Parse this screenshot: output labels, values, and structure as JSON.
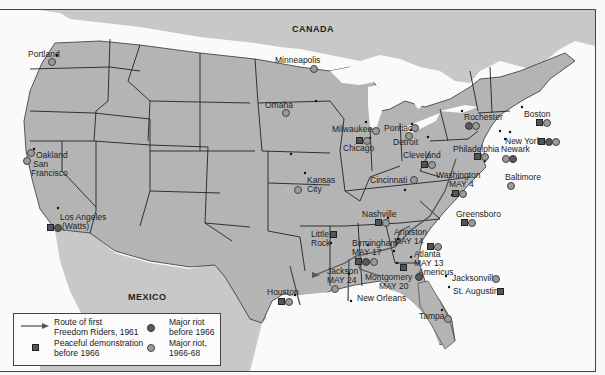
{
  "map": {
    "countries": {
      "north": "CANADA",
      "south": "MEXICO"
    },
    "colors": {
      "land": "#b4b4b4",
      "neighbor_land": "#c8c8c8",
      "water": "#fafafa",
      "borders": "#222222",
      "route": "#555555"
    },
    "cities": [
      {
        "name": "Portland",
        "markers": [
          "riot_1966_68"
        ]
      },
      {
        "name": "Oakland",
        "markers": [
          "riot_1966_68"
        ]
      },
      {
        "name": "San Francisco",
        "markers": [
          "riot_1966_68"
        ]
      },
      {
        "name": "Los Angeles (Watts)",
        "markers": [
          "peaceful",
          "riot_before_1966"
        ]
      },
      {
        "name": "Minneapolis",
        "markers": [
          "riot_1966_68"
        ]
      },
      {
        "name": "Omaha",
        "markers": [
          "riot_1966_68"
        ]
      },
      {
        "name": "Kansas City",
        "markers": [
          "riot_1966_68"
        ]
      },
      {
        "name": "Milwaukee",
        "markers": [
          "riot_1966_68"
        ]
      },
      {
        "name": "Chicago",
        "markers": [
          "peaceful",
          "riot_1966_68"
        ]
      },
      {
        "name": "Pontiac",
        "markers": [
          "riot_1966_68"
        ]
      },
      {
        "name": "Detroit",
        "markers": [
          "riot_1966_68"
        ]
      },
      {
        "name": "Cleveland",
        "markers": [
          "peaceful",
          "riot_1966_68"
        ]
      },
      {
        "name": "Cincinnati",
        "markers": [
          "riot_1966_68"
        ]
      },
      {
        "name": "Rochester",
        "markers": [
          "riot_before_1966",
          "riot_1966_68"
        ]
      },
      {
        "name": "Boston",
        "markers": [
          "peaceful",
          "riot_1966_68"
        ]
      },
      {
        "name": "New York",
        "markers": [
          "peaceful",
          "riot_before_1966",
          "riot_1966_68"
        ]
      },
      {
        "name": "Newark",
        "markers": [
          "riot_1966_68",
          "riot_before_1966"
        ]
      },
      {
        "name": "Philadelphia",
        "markers": [
          "peaceful",
          "riot_1966_68"
        ]
      },
      {
        "name": "Baltimore",
        "markers": [
          "riot_1966_68"
        ]
      },
      {
        "name": "Washington",
        "date": "MAY 4",
        "markers": [
          "peaceful",
          "riot_1966_68"
        ]
      },
      {
        "name": "Nashville",
        "markers": [
          "peaceful",
          "riot_1966_68"
        ]
      },
      {
        "name": "Greensboro",
        "markers": [
          "peaceful",
          "riot_1966_68"
        ]
      },
      {
        "name": "Little Rock",
        "markers": [
          "peaceful"
        ]
      },
      {
        "name": "Anniston",
        "date": "MAY 14",
        "markers": [
          "peaceful",
          "riot_1966_68"
        ]
      },
      {
        "name": "Birmingham",
        "date": "MAY 17",
        "markers": [
          "peaceful",
          "riot_before_1966",
          "riot_1966_68"
        ]
      },
      {
        "name": "Atlanta",
        "date": "MAY 13",
        "markers": []
      },
      {
        "name": "Americus",
        "markers": [
          "riot_before_1966"
        ]
      },
      {
        "name": "Montgomery",
        "date": "MAY 20",
        "markers": [
          "peaceful"
        ]
      },
      {
        "name": "Jackson",
        "date": "MAY 24",
        "markers": [
          "riot_1966_68"
        ]
      },
      {
        "name": "New Orleans",
        "markers": []
      },
      {
        "name": "Houston",
        "markers": [
          "peaceful",
          "riot_1966_68"
        ]
      },
      {
        "name": "Jacksonville",
        "markers": [
          "riot_1966_68"
        ]
      },
      {
        "name": "St. Augustine",
        "markers": [
          "peaceful"
        ]
      },
      {
        "name": "Tampa",
        "markers": [
          "riot_1966_68"
        ]
      }
    ]
  },
  "labels": {
    "portland": "Portland",
    "oakland": "Oakland",
    "sanfrancisco_1": "San",
    "sanfrancisco_2": "Francisco",
    "losangeles_1": "Los Angeles",
    "losangeles_2": "(Watts)",
    "minneapolis": "Minneapolis",
    "omaha": "Omaha",
    "kansascity_1": "Kansas",
    "kansascity_2": "City",
    "milwaukee": "Milwaukee",
    "chicago": "Chicago",
    "pontiac": "Pontiac",
    "detroit": "Detroit",
    "cleveland": "Cleveland",
    "cincinnati": "Cincinnati",
    "rochester": "Rochester",
    "boston": "Boston",
    "newyork": "New York",
    "newark": "Newark",
    "philadelphia": "Philadelphia",
    "baltimore": "Baltimore",
    "washington": "Washington",
    "washington_date": "MAY 4",
    "nashville": "Nashville",
    "greensboro": "Greensboro",
    "littlerock_1": "Little",
    "littlerock_2": "Rock",
    "anniston": "Anniston",
    "anniston_date": "MAY 14",
    "birmingham": "Birmingham",
    "birmingham_date": "MAY 17",
    "atlanta": "Atlanta",
    "atlanta_date": "MAY 13",
    "americus": "Americus",
    "montgomery": "Montgomery",
    "montgomery_date": "MAY 20",
    "jackson": "Jackson",
    "jackson_date": "MAY 24",
    "neworleans": "New Orleans",
    "houston": "Houston",
    "jacksonville": "Jacksonville",
    "staugustine": "St. Augustine",
    "tampa": "Tampa"
  },
  "legend": {
    "route_1": "Route of first",
    "route_2": "Freedom Riders, 1961",
    "peaceful_1": "Peaceful demonstration",
    "peaceful_2": "before 1966",
    "riot_before_1": "Major riot",
    "riot_before_2": "before 1966",
    "riot_after_1": "Major riot,",
    "riot_after_2": "1966-68"
  }
}
